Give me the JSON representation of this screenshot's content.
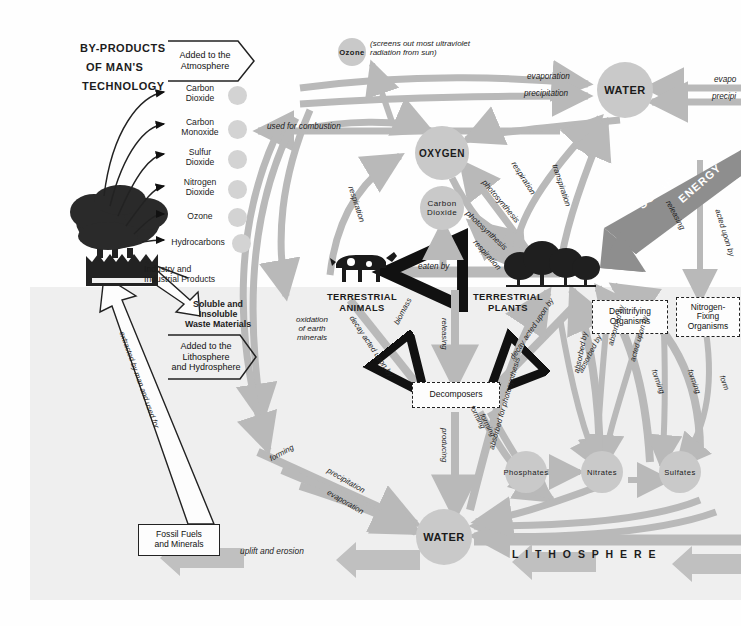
{
  "diagram": {
    "title_block": {
      "line1": "BY-PRODUCTS",
      "line2": "OF MAN'S",
      "line3": "TECHNOLOGY"
    },
    "chevrons": {
      "atmosphere": "Added to the\nAtmosphere",
      "lithosphere": "Added to the\nLithosphere\nand Hydrosphere"
    },
    "byproducts": [
      "Carbon\nDioxide",
      "Carbon\nMonoxide",
      "Sulfur\nDioxide",
      "Nitrogen\nDioxide",
      "Ozone",
      "Hydrocarbons"
    ],
    "captions": {
      "industry": "Industry and\nIndustrial Products",
      "waste": "Soluble and\nInsoluble\nWaste Materials",
      "ozone_note": "(screens out most ultraviolet\nradiation from sun)"
    },
    "nodes": {
      "ozone": "Ozone",
      "water_top": "WATER",
      "oxygen": "OXYGEN",
      "carbon_dioxide": "Carbon\nDioxide",
      "water_bottom": "WATER",
      "phosphates": "Phosphates",
      "nitrates": "Nitrates",
      "sulfates": "Sulfates"
    },
    "boxes": {
      "decomposers": "Decomposers",
      "denitrifying": "Denitrifying\nOrganisms",
      "nitrogen_fixing": "Nitrogen-\nFixing\nOrganisms",
      "fossil_fuels": "Fossil Fuels\nand Minerals"
    },
    "organisms": {
      "animals": "TERRESTRIAL\nANIMALS",
      "plants": "TERRESTRIAL\nPLANTS"
    },
    "zone_label": "L I T H O S P H E R E",
    "energy": {
      "word1": "SOLAR",
      "word2": "ENERGY"
    },
    "flow_labels": {
      "used_for_combustion": "used for combustion",
      "evaporation_left": "evaporation",
      "precipitation_left": "precipitation",
      "evaporation_right": "evapo",
      "precipitation_right": "precipi",
      "transpiration": "transpiration",
      "respiration_left": "respiration",
      "respiration_o2": "respiration",
      "photosynthesis_o2": "photosynthesis",
      "photosynthesis_co2": "photosynthesis",
      "respiration_co2": "respiration",
      "eaten_by": "eaten     by",
      "releasing_solar": "releasing",
      "acted_upon_by_right": "acted upon by",
      "oxidation": "oxidation\nof earth\nminerals",
      "decay_animals": "decay acted upon by",
      "decay_plants": "decay acted upon by",
      "releasing": "releasing",
      "producing": "producing",
      "biomass": "biomass",
      "absorbed_for_photosynthesis": "absorbed for photosynthesis",
      "forming_a": "forming",
      "forming_b": "forming",
      "absorbed_by_1": "absorbed by",
      "absorbed_by_2": "absorbed by",
      "absorbed_by_3": "absorbed by",
      "acted_upon_by_mid": "acted upon by",
      "forming_n1": "forming",
      "forming_n2": "forming",
      "forming_n3": "form",
      "acted_upon_by_nf": "acted upon by",
      "forming_left": "forming",
      "precipitation_mid": "precipitation",
      "evaporation_mid": "evaporation",
      "extracted": "extracted by man and used for",
      "uplift_erosion": "uplift   and   erosion"
    },
    "colors": {
      "flow_arrow": "#b9b9b9",
      "node_fill": "#c9c9c9",
      "lithosphere_bg": "#efefef",
      "energy_bar": "#8e8e8e",
      "text": "#1c1c1c"
    }
  }
}
